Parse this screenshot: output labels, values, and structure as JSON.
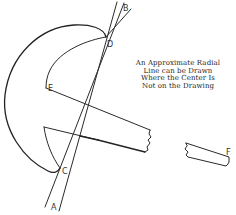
{
  "figure": {
    "caption_lines": [
      "An Approximate Radial",
      "Line can be Drawn",
      "Where the Center Is",
      "Not on the Drawing"
    ],
    "point_labels": {
      "A": "A",
      "B": "B",
      "C": "C",
      "D": "D",
      "E": "E",
      "F": "F"
    },
    "colors": {
      "ink": "#2a2a2a",
      "background": "#ffffff"
    }
  }
}
